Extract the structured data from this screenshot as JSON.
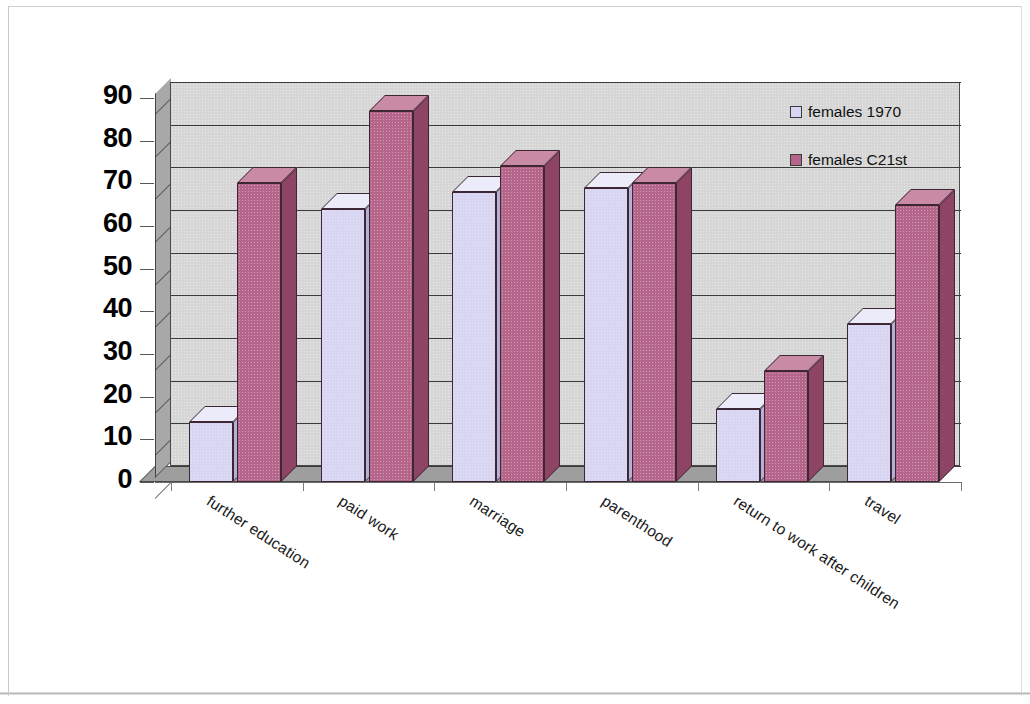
{
  "chart_data": {
    "type": "bar",
    "title": "",
    "subtitle": "",
    "xlabel": "",
    "ylabel": "",
    "ylim": [
      0,
      90
    ],
    "ytick_step": 10,
    "yticks": [
      "90",
      "80",
      "70",
      "60",
      "50",
      "40",
      "30",
      "20",
      "10",
      "0"
    ],
    "grid": true,
    "grid_axis": "y",
    "legend_position": "top-right inside plot",
    "style": "3d-clustered-column",
    "categories": [
      "further education",
      "paid work",
      "marriage",
      "parenthood",
      "return to work after children",
      "travel"
    ],
    "series": [
      {
        "name": "females 1970",
        "color": "#d8d5f2",
        "values": [
          14,
          64,
          68,
          69,
          17,
          37
        ]
      },
      {
        "name": "females C21st",
        "color": "#b5648a",
        "values": [
          70,
          87,
          74,
          70,
          26,
          65
        ]
      }
    ]
  },
  "legend": {
    "items": [
      {
        "label": "females 1970",
        "swatch": "#d8d5f2"
      },
      {
        "label": "females C21st",
        "swatch": "#b5648a"
      }
    ]
  },
  "colors": {
    "series_1_front": "#d8d5f2",
    "series_1_top": "#ecebf9",
    "series_1_side": "#b4b0da",
    "series_2_front": "#b5648a",
    "series_2_top": "#c98aa6",
    "series_2_side": "#8e4465",
    "plot_back_wall": "#d6d6d6",
    "plot_left_wall": "#a8a8a8",
    "plot_floor": "#9e9e9e",
    "gridline": "#3a3a3a",
    "axis_text": "#000000",
    "page_background": "#ffffff"
  }
}
